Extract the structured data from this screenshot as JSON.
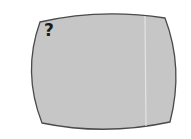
{
  "screen": {
    "symbol": "?",
    "fill_color": "#c6c6c6",
    "border_color": "#4a4a4a",
    "scanline_color": "#e4e4e4"
  }
}
